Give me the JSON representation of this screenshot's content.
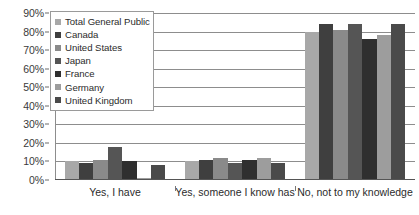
{
  "chart_data": {
    "type": "bar",
    "title": "",
    "subtitle": "",
    "xlabel": "",
    "ylabel": "",
    "ylim": [
      0,
      90
    ],
    "ytick_values": [
      0,
      10,
      20,
      30,
      40,
      50,
      60,
      70,
      80,
      90
    ],
    "ytick_labels": [
      "0%",
      "10%",
      "20%",
      "30%",
      "40%",
      "50%",
      "60%",
      "70%",
      "80%",
      "90%"
    ],
    "grid": true,
    "legend_position": "top-left",
    "categories": [
      "Yes, I have",
      "Yes, someone I know has",
      "No, not to my knowledge"
    ],
    "series": [
      {
        "name": "Total General Public",
        "color": "#a8a8a8",
        "values": [
          10,
          10,
          80
        ]
      },
      {
        "name": "Canada",
        "color": "#3f3f3f",
        "values": [
          9,
          11,
          84
        ]
      },
      {
        "name": "United States",
        "color": "#8a8a8a",
        "values": [
          11,
          12,
          81
        ]
      },
      {
        "name": "Japan",
        "color": "#555555",
        "values": [
          18,
          9,
          84
        ]
      },
      {
        "name": "France",
        "color": "#2f2f2f",
        "values": [
          10,
          11,
          76
        ]
      },
      {
        "name": "Germany",
        "color": "#9d9d9d",
        "values": [
          1,
          12,
          78
        ]
      },
      {
        "name": "United Kingdom",
        "color": "#4a4a4a",
        "values": [
          8,
          9,
          84
        ]
      }
    ]
  },
  "legend": {
    "items": [
      {
        "label": "Total General Public"
      },
      {
        "label": "Canada"
      },
      {
        "label": "United States"
      },
      {
        "label": "Japan"
      },
      {
        "label": "France"
      },
      {
        "label": "Germany"
      },
      {
        "label": "United Kingdom"
      }
    ]
  },
  "colors": {
    "gridline": "#8d8d8d",
    "axis": "#555555",
    "text": "#2b2b2b",
    "background": "#ffffff"
  }
}
